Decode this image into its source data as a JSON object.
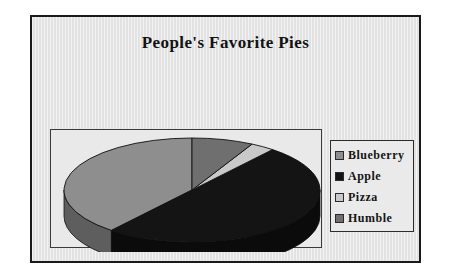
{
  "chart_data": {
    "type": "pie",
    "title": "People's Favorite Pies",
    "xlabel": "",
    "ylabel": "",
    "legend_position": "right",
    "three_d": true,
    "categories": [
      "Blueberry",
      "Apple",
      "Pizza",
      "Humble"
    ],
    "values": [
      39,
      50,
      3,
      8
    ],
    "series": [
      {
        "name": "People's Favorite Pies",
        "values": [
          39,
          50,
          3,
          8
        ]
      }
    ],
    "slices": [
      {
        "label": "Blueberry",
        "value": 39,
        "color": "#8e8e8e",
        "side_color": "#5e5e5e",
        "start_angle": 219,
        "end_angle": 360
      },
      {
        "label": "Apple",
        "value": 50,
        "color": "#141414",
        "side_color": "#0b0b0b",
        "start_angle": 39,
        "end_angle": 219
      },
      {
        "label": "Pizza",
        "value": 3,
        "color": "#c9c9c9",
        "side_color": "#9a9a9a",
        "start_angle": 28,
        "end_angle": 39
      },
      {
        "label": "Humble",
        "value": 8,
        "color": "#6f6f6f",
        "side_color": "#4a4a4a",
        "start_angle": 0,
        "end_angle": 28
      }
    ]
  },
  "chart": {
    "title": "People's Favorite Pies",
    "background_color": "#e9e9e9",
    "border_color": "#1a1a1a",
    "plot_border_color": "#3a3a3a"
  },
  "legend": {
    "border_color": "#2b2b2b",
    "items": [
      {
        "label": "Blueberry",
        "color": "#8e8e8e"
      },
      {
        "label": "Apple",
        "color": "#141414"
      },
      {
        "label": "Pizza",
        "color": "#c9c9c9"
      },
      {
        "label": "Humble",
        "color": "#6f6f6f"
      }
    ]
  }
}
